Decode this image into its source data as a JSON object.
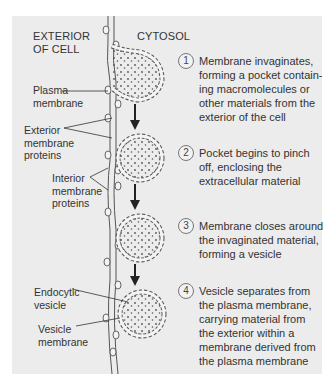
{
  "headers": {
    "exterior": "EXTERIOR\nOF CELL",
    "cytosol": "CYTOSOL"
  },
  "labels": {
    "plasma_membrane": "Plasma\nmembrane",
    "exterior_membrane_proteins": "Exterior\nmembrane\nproteins",
    "interior_membrane_proteins": "Interior\nmembrane\nproteins",
    "endocytic_vesicle": "Endocytic\nvesicle",
    "vesicle_membrane": "Vesicle\nmembrane"
  },
  "steps": [
    {
      "number": "1",
      "text": "Membrane invaginates,\nforming a pocket contain-\ning macromolecules or\nother materials from the\nexterior of the cell"
    },
    {
      "number": "2",
      "text": "Pocket begins to pinch\noff, enclosing the\nextracellular material"
    },
    {
      "number": "3",
      "text": "Membrane closes around\nthe invaginated material,\nforming a vesicle"
    },
    {
      "number": "4",
      "text": "Vesicle separates from\nthe plasma membrane,\ncarrying material from\nthe exterior within a\nmembrane derived from\nthe plasma membrane"
    }
  ],
  "colors": {
    "panel": "#ececec",
    "membrane_stroke": "#555555",
    "membrane_fill": "#f4f4f4"
  }
}
